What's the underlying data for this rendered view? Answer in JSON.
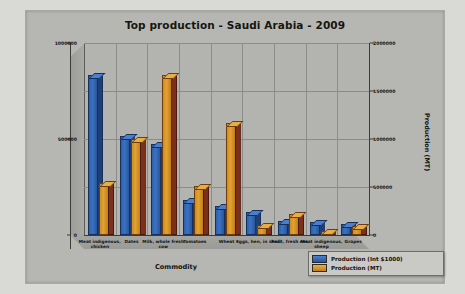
{
  "chart_data": {
    "type": "bar",
    "title": "Top production - Saudi Arabia - 2009",
    "xlabel": "Commodity",
    "ylabel": "Production (Int $1000)",
    "ylabel_secondary": "Production (MT)",
    "categories": [
      "Meat indigenous, chicken",
      "Dates",
      "Milk, whole fresh cow",
      "Tomatoes",
      "Wheat",
      "Eggs, hen, in shell",
      "Fruit, fresh nes",
      "Meat indigenous, sheep",
      "Grapes"
    ],
    "series": [
      {
        "name": "Production (Int $1000)",
        "color": "#3a72c4",
        "axis": "left",
        "values": [
          825000,
          505000,
          465000,
          170000,
          140000,
          110000,
          65000,
          55000,
          45000
        ]
      },
      {
        "name": "Production (MT)",
        "color": "#e2a233",
        "axis": "right",
        "values": [
          525000,
          980000,
          1650000,
          490000,
          1150000,
          85000,
          195000,
          25000,
          75000
        ]
      }
    ],
    "ylim": [
      0,
      1000000
    ],
    "ylim_secondary": [
      0,
      2000000
    ],
    "yticks": [
      "0",
      "500000",
      "1000000"
    ],
    "yticks_secondary": [
      "0",
      "500000",
      "1000000",
      "1500000",
      "2000000"
    ],
    "grid": true,
    "legend_position": "bottom-right",
    "style": "3d-column"
  },
  "legend": {
    "items": [
      {
        "label": "Production (Int $1000)",
        "swatch": "blue"
      },
      {
        "label": "Production (MT)",
        "swatch": "orange"
      }
    ]
  }
}
